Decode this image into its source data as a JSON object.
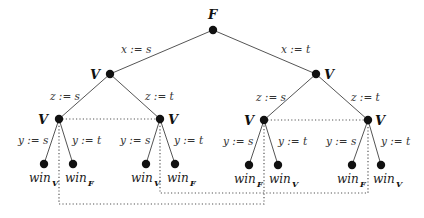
{
  "diagram": {
    "type": "game-tree",
    "root": {
      "player": "F",
      "x": 213,
      "y": 30
    },
    "level1": [
      {
        "id": "L",
        "player": "V",
        "x": 110,
        "y": 74,
        "edge_label": "x := s"
      },
      {
        "id": "R",
        "player": "V",
        "x": 316,
        "y": 74,
        "edge_label": "x := t"
      }
    ],
    "level2": [
      {
        "id": "LL",
        "parent": "L",
        "player": "V",
        "x": 59,
        "y": 119,
        "edge_label": "z := s"
      },
      {
        "id": "LR",
        "parent": "L",
        "player": "V",
        "x": 160,
        "y": 119,
        "edge_label": "z := t"
      },
      {
        "id": "RL",
        "parent": "R",
        "player": "V",
        "x": 264,
        "y": 120,
        "edge_label": "z := s"
      },
      {
        "id": "RR",
        "parent": "R",
        "player": "V",
        "x": 368,
        "y": 120,
        "edge_label": "z := t"
      }
    ],
    "leaves": [
      {
        "parent": "LL",
        "x": 44,
        "y": 164,
        "edge_label": "y := s",
        "outcome": "win",
        "winner": "V"
      },
      {
        "parent": "LL",
        "x": 73,
        "y": 164,
        "edge_label": "y := t",
        "outcome": "win",
        "winner": "F"
      },
      {
        "parent": "LR",
        "x": 146,
        "y": 164,
        "edge_label": "y := s",
        "outcome": "win",
        "winner": "V"
      },
      {
        "parent": "LR",
        "x": 175,
        "y": 164,
        "edge_label": "y := t",
        "outcome": "win",
        "winner": "F"
      },
      {
        "parent": "RL",
        "x": 249,
        "y": 165,
        "edge_label": "y := s",
        "outcome": "win",
        "winner": "F"
      },
      {
        "parent": "RL",
        "x": 278,
        "y": 165,
        "edge_label": "y := t",
        "outcome": "win",
        "winner": "V"
      },
      {
        "parent": "RR",
        "x": 352,
        "y": 165,
        "edge_label": "y := s",
        "outcome": "win",
        "winner": "F"
      },
      {
        "parent": "RR",
        "x": 381,
        "y": 165,
        "edge_label": "y := t",
        "outcome": "win",
        "winner": "V"
      }
    ],
    "information_sets": [
      {
        "nodes": [
          "LL",
          "LR"
        ],
        "style": "dotted"
      },
      {
        "nodes": [
          "RL",
          "RR"
        ],
        "style": "dotted"
      },
      {
        "nodes": [
          "LL",
          "RL"
        ],
        "style": "dotted",
        "route_y": 204
      },
      {
        "nodes": [
          "LR",
          "RR"
        ],
        "style": "dotted",
        "route_y": 193
      }
    ]
  },
  "labels": {
    "root_player": "F",
    "x_s": "x := s",
    "x_t": "x := t",
    "z_s": "z := s",
    "z_t": "z := t",
    "y_s": "y := s",
    "y_t": "y := t",
    "player_v": "V",
    "win": "win",
    "sub_v": "V",
    "sub_f": "F"
  }
}
